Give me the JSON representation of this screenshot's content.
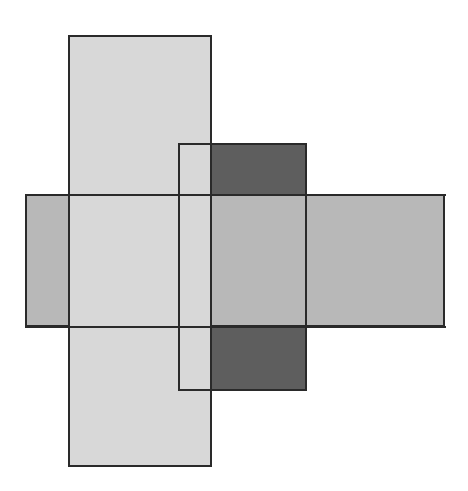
{
  "diagram": {
    "canvas": {
      "width": 468,
      "height": 491,
      "background": "#ffffff"
    },
    "stroke_color": "#2a2a2a",
    "fills": {
      "light": "#e3e3e3",
      "medium": "#c5c5c5",
      "dark": "#6b6b6b"
    },
    "shapes": [
      {
        "id": "horizontal-band",
        "fill": "medium",
        "x": 25,
        "y": 194,
        "w": 420,
        "h": 133
      },
      {
        "id": "tall-rect",
        "fill": "light",
        "x": 68,
        "y": 35,
        "w": 143,
        "h": 431
      },
      {
        "id": "dark-top-square",
        "fill": "dark",
        "x": 211,
        "y": 143,
        "w": 95,
        "h": 51
      },
      {
        "id": "dark-bottom-square",
        "fill": "dark",
        "x": 211,
        "y": 327,
        "w": 95,
        "h": 63
      },
      {
        "id": "narrow-rect-outline",
        "fill": "none",
        "x": 178,
        "y": 143,
        "w": 128,
        "h": 247
      }
    ]
  }
}
